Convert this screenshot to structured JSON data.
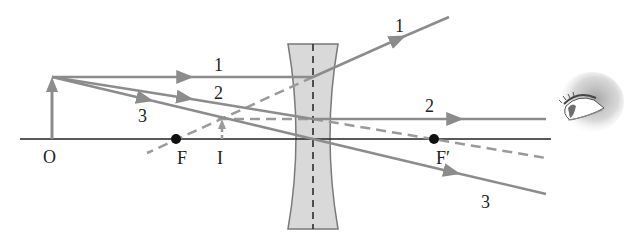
{
  "diagram": {
    "colors": {
      "ray": "#8c8c8c",
      "axis": "#222222",
      "lens_fill": "#d9d9d9",
      "lens_stroke": "#7a7a7a",
      "focal_point": "#111111",
      "label": "#222222"
    },
    "labels": {
      "object": "O",
      "focus": "F",
      "image": "I",
      "focus_prime": "F′",
      "ray1_left": "1",
      "ray1_right": "1",
      "ray2_left": "2",
      "ray2_right": "2",
      "ray3_left": "3",
      "ray3_right": "3"
    },
    "elements": {
      "optical_axis": "horizontal principal axis",
      "lens": "concave (diverging) lens",
      "object_arrow": "upright object O",
      "image_arrow": "virtual upright image I",
      "eye": "observer eye icon"
    }
  }
}
